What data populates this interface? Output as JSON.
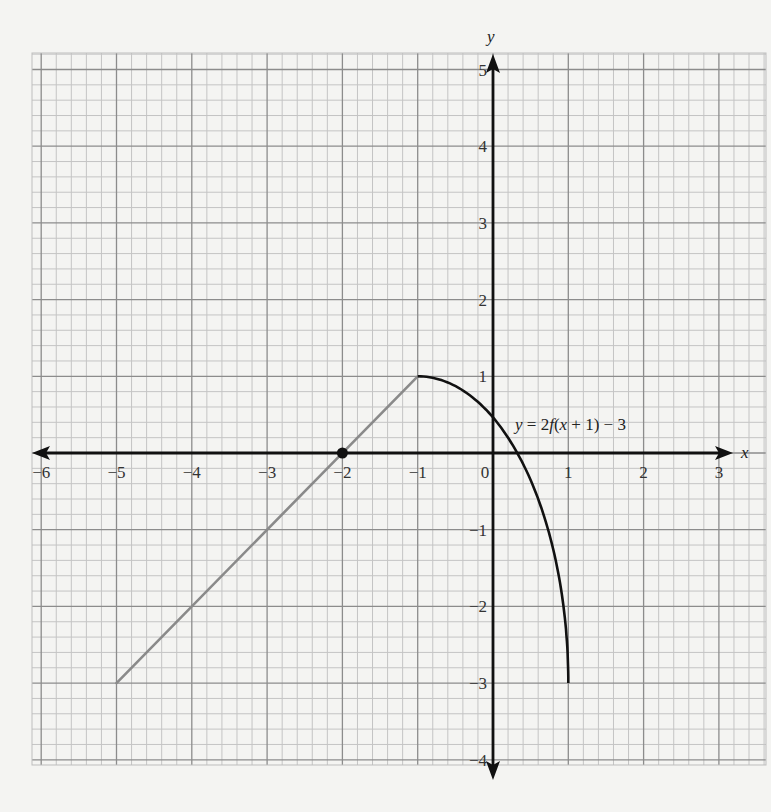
{
  "chart_data": {
    "type": "line",
    "title": "",
    "xlabel": "x",
    "ylabel": "y",
    "xlim": [
      -6,
      3
    ],
    "ylim": [
      -4,
      5
    ],
    "grid": true,
    "grid_minor_subdivisions": 5,
    "x_ticks": [
      -6,
      -5,
      -4,
      -3,
      -2,
      -1,
      0,
      1,
      2,
      3
    ],
    "y_ticks": [
      -4,
      -3,
      -2,
      -1,
      1,
      2,
      3,
      4,
      5
    ],
    "series": [
      {
        "name": "linear segment",
        "color": "#8a8a8a",
        "points": [
          [
            -5,
            -3
          ],
          [
            -1,
            1
          ]
        ]
      },
      {
        "name": "y = 2f(x + 1) − 3",
        "color": "#111111",
        "shape": "quarter-ellipse",
        "points": [
          [
            -1,
            1
          ],
          [
            0,
            0.5
          ],
          [
            0.3,
            0
          ],
          [
            0.6,
            -1
          ],
          [
            0.85,
            -2
          ],
          [
            1,
            -3
          ]
        ]
      }
    ],
    "marked_points": [
      {
        "x": -2,
        "y": 0,
        "style": "closed-dot"
      }
    ],
    "annotations": [
      {
        "text": "y = 2f(x + 1) − 3",
        "x": 0.4,
        "y": 0.35
      }
    ]
  },
  "labels": {
    "x_axis": "x",
    "y_axis": "y",
    "equation": "y = 2f(x + 1) − 3"
  }
}
